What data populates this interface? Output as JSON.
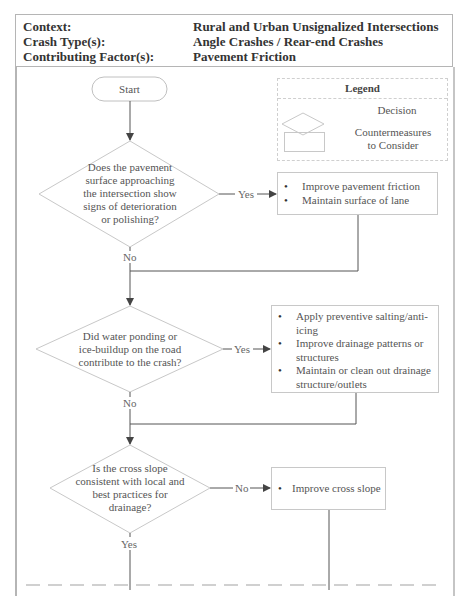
{
  "header": {
    "rows": [
      {
        "label": "Context:",
        "value": "Rural and Urban Unsignalized Intersections"
      },
      {
        "label": "Crash Type(s):",
        "value": "Angle Crashes / Rear-end Crashes"
      },
      {
        "label": "Contributing Factor(s):",
        "value": "Pavement Friction"
      }
    ]
  },
  "legend": {
    "title": "Legend",
    "items": [
      {
        "shape": "diamond",
        "label": "Decision"
      },
      {
        "shape": "rectangle",
        "label_line1": "Countermeasures",
        "label_line2": "to Consider"
      }
    ]
  },
  "flow": {
    "start": "Start",
    "decisions": [
      {
        "text_lines": [
          "Does the pavement",
          "surface approaching",
          "the intersection show",
          "signs of deterioration",
          "or polishing?"
        ],
        "branch_side_label": "Yes",
        "branch_down_label": "No"
      },
      {
        "text_lines": [
          "Did water ponding or",
          "ice-buildup on the road",
          "contribute to the crash?"
        ],
        "branch_side_label": "Yes",
        "branch_down_label": "No"
      },
      {
        "text_lines": [
          "Is the cross slope",
          "consistent with local and",
          "best practices for",
          "drainage?"
        ],
        "branch_side_label": "No",
        "branch_down_label": "Yes"
      }
    ],
    "countermeasures": [
      {
        "items": [
          "Improve pavement friction",
          "Maintain surface of lane"
        ]
      },
      {
        "items": [
          "Apply preventive salting/anti-icing",
          "Improve drainage patterns or structures",
          "Maintain or clean out drainage structure/outlets"
        ]
      },
      {
        "items": [
          "Improve cross slope"
        ]
      }
    ]
  },
  "colors": {
    "shape_stroke": "#c8c8c8",
    "connector": "#555555",
    "header_text": "#333333",
    "border": "#b5b5b5"
  }
}
